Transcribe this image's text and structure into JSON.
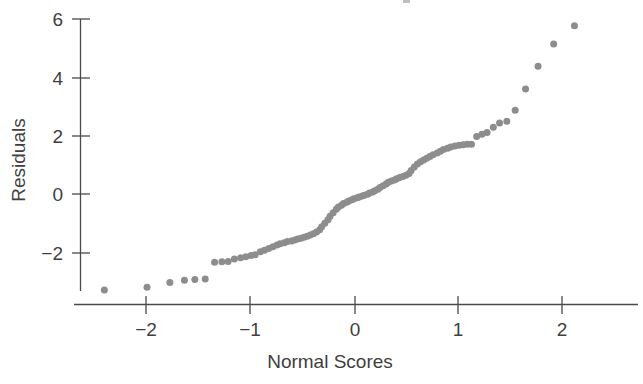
{
  "chart_data": {
    "type": "scatter",
    "title": "",
    "xlabel": "Normal Scores",
    "ylabel": "Residuals",
    "xlim": [
      -2.63,
      2.75
    ],
    "ylim": [
      -3.55,
      6.35
    ],
    "xticks": [
      -2,
      -1,
      0,
      1,
      2
    ],
    "xticklabels": [
      "−2",
      "−1",
      "0",
      "1",
      "2"
    ],
    "yticks": [
      -2,
      0,
      2,
      4,
      6
    ],
    "yticklabels": [
      "−2",
      "0",
      "2",
      "4",
      "6"
    ],
    "grid": false,
    "legend": null,
    "marker": {
      "shape": "circle",
      "size_px": 7,
      "color": "#8d8d8d"
    },
    "axis_color": "#4a4a4a",
    "background": "#ffffff",
    "n_points": 101,
    "points": [
      [
        -2.41,
        -3.28
      ],
      [
        -2.0,
        -3.18
      ],
      [
        -1.78,
        -3.02
      ],
      [
        -1.64,
        -2.94
      ],
      [
        -1.54,
        -2.92
      ],
      [
        -1.44,
        -2.9
      ],
      [
        -1.35,
        -2.33
      ],
      [
        -1.28,
        -2.31
      ],
      [
        -1.22,
        -2.3
      ],
      [
        -1.16,
        -2.22
      ],
      [
        -1.1,
        -2.18
      ],
      [
        -1.05,
        -2.14
      ],
      [
        -1.0,
        -2.1
      ],
      [
        -0.96,
        -2.07
      ],
      [
        -0.91,
        -1.97
      ],
      [
        -0.87,
        -1.92
      ],
      [
        -0.83,
        -1.86
      ],
      [
        -0.79,
        -1.8
      ],
      [
        -0.75,
        -1.74
      ],
      [
        -0.72,
        -1.7
      ],
      [
        -0.68,
        -1.66
      ],
      [
        -0.65,
        -1.62
      ],
      [
        -0.61,
        -1.6
      ],
      [
        -0.58,
        -1.57
      ],
      [
        -0.55,
        -1.54
      ],
      [
        -0.52,
        -1.51
      ],
      [
        -0.49,
        -1.48
      ],
      [
        -0.46,
        -1.44
      ],
      [
        -0.43,
        -1.4
      ],
      [
        -0.4,
        -1.36
      ],
      [
        -0.37,
        -1.3
      ],
      [
        -0.34,
        -1.22
      ],
      [
        -0.32,
        -1.12
      ],
      [
        -0.29,
        -1.0
      ],
      [
        -0.26,
        -0.88
      ],
      [
        -0.24,
        -0.76
      ],
      [
        -0.21,
        -0.64
      ],
      [
        -0.18,
        -0.52
      ],
      [
        -0.16,
        -0.44
      ],
      [
        -0.13,
        -0.38
      ],
      [
        -0.11,
        -0.32
      ],
      [
        -0.08,
        -0.28
      ],
      [
        -0.06,
        -0.24
      ],
      [
        -0.03,
        -0.2
      ],
      [
        -0.01,
        -0.16
      ],
      [
        0.02,
        -0.13
      ],
      [
        0.04,
        -0.1
      ],
      [
        0.07,
        -0.07
      ],
      [
        0.09,
        -0.04
      ],
      [
        0.12,
        -0.01
      ],
      [
        0.14,
        0.03
      ],
      [
        0.17,
        0.07
      ],
      [
        0.19,
        0.11
      ],
      [
        0.22,
        0.16
      ],
      [
        0.24,
        0.22
      ],
      [
        0.27,
        0.28
      ],
      [
        0.3,
        0.34
      ],
      [
        0.32,
        0.4
      ],
      [
        0.35,
        0.44
      ],
      [
        0.38,
        0.48
      ],
      [
        0.4,
        0.52
      ],
      [
        0.43,
        0.56
      ],
      [
        0.46,
        0.6
      ],
      [
        0.49,
        0.64
      ],
      [
        0.52,
        0.7
      ],
      [
        0.54,
        0.8
      ],
      [
        0.57,
        0.92
      ],
      [
        0.6,
        1.02
      ],
      [
        0.63,
        1.1
      ],
      [
        0.66,
        1.16
      ],
      [
        0.69,
        1.22
      ],
      [
        0.72,
        1.28
      ],
      [
        0.75,
        1.34
      ],
      [
        0.79,
        1.4
      ],
      [
        0.82,
        1.46
      ],
      [
        0.85,
        1.52
      ],
      [
        0.89,
        1.56
      ],
      [
        0.92,
        1.6
      ],
      [
        0.96,
        1.64
      ],
      [
        1.0,
        1.66
      ],
      [
        1.04,
        1.68
      ],
      [
        1.08,
        1.7
      ],
      [
        1.12,
        1.7
      ],
      [
        1.17,
        1.96
      ],
      [
        1.22,
        2.04
      ],
      [
        1.27,
        2.1
      ],
      [
        1.33,
        2.28
      ],
      [
        1.39,
        2.42
      ],
      [
        1.46,
        2.48
      ],
      [
        1.54,
        2.86
      ],
      [
        1.64,
        3.58
      ],
      [
        1.76,
        4.36
      ],
      [
        1.91,
        5.12
      ],
      [
        2.11,
        5.74
      ]
    ]
  },
  "axes": {
    "y_axis_title": "Residuals",
    "x_axis_title": "Normal Scores"
  }
}
